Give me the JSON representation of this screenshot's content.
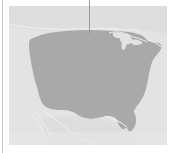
{
  "widget": {
    "kind": "map-thumbnail",
    "region_label": "United States"
  },
  "colors": {
    "page_background": "#ffffff",
    "panel_background": "#e3e3e3",
    "panel_top_edge": "#f2f2f2",
    "land_fill": "#a9a9a9",
    "land_fill_light": "#b4b4b4",
    "coastline_stroke": "#f0f0f0",
    "lake_fill": "#e3e3e3",
    "leader_line": "#9a9a9a",
    "left_rule": "#c8c8c8"
  },
  "layout": {
    "width": 169,
    "height": 153,
    "panel": {
      "x": 9,
      "y": 6,
      "w": 158,
      "h": 139
    },
    "left_rule": {
      "x": 2,
      "y": 0,
      "w": 1,
      "h": 153
    },
    "leader_line": {
      "x": 89,
      "y": 0,
      "w": 1,
      "h": 34
    }
  },
  "map": {
    "projection_note": "contiguous-united-states",
    "features": [
      {
        "name": "contiguous-us-landmass",
        "type": "filled-region",
        "fill": "#a9a9a9"
      },
      {
        "name": "canada-landmass",
        "type": "outline-region",
        "fill": "#dcdcdc"
      },
      {
        "name": "mexico-landmass",
        "type": "outline-region",
        "fill": "#dcdcdc"
      },
      {
        "name": "baja-california-peninsula",
        "type": "outline",
        "stroke": "#f0f0f0"
      },
      {
        "name": "great-lakes",
        "type": "water-body",
        "fill": "#e3e3e3"
      },
      {
        "name": "florida-peninsula",
        "type": "coast-detail"
      },
      {
        "name": "gulf-of-mexico-coast",
        "type": "coast-detail"
      },
      {
        "name": "pacific-coast",
        "type": "coast-detail"
      },
      {
        "name": "atlantic-coast",
        "type": "coast-detail"
      }
    ]
  },
  "annotation": {
    "leader_line_name": "callout-leader-line",
    "leader_target": "northern-border"
  }
}
